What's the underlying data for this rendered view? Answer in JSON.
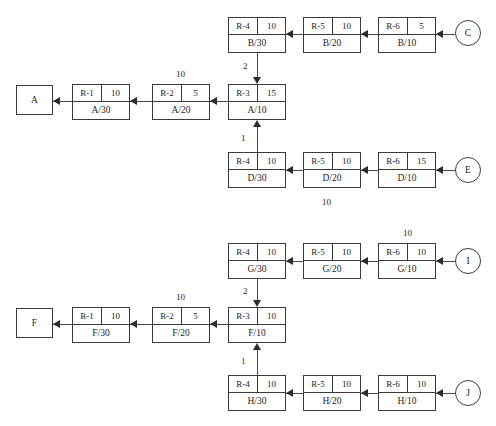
{
  "diagram": {
    "colors": {
      "line": "#4a4a4a",
      "border": "#3a3a3a",
      "text": "#1c1c1c",
      "background": "#ffffff"
    },
    "terminals": {
      "a": "A",
      "f": "F",
      "c": "C",
      "e": "E",
      "i": "I",
      "j": "J"
    },
    "nodes": {
      "b30": {
        "name": "R-4",
        "value": "10",
        "label": "B/30"
      },
      "b20": {
        "name": "R-5",
        "value": "10",
        "label": "B/20"
      },
      "b10": {
        "name": "R-6",
        "value": "5",
        "label": "B/10"
      },
      "a30": {
        "name": "R-1",
        "value": "10",
        "label": "A/30"
      },
      "a20": {
        "name": "R-2",
        "value": "5",
        "label": "A/20"
      },
      "a10": {
        "name": "R-3",
        "value": "15",
        "label": "A/10"
      },
      "d30": {
        "name": "R-4",
        "value": "10",
        "label": "D/30"
      },
      "d20": {
        "name": "R-5",
        "value": "10",
        "label": "D/20"
      },
      "d10": {
        "name": "R-6",
        "value": "15",
        "label": "D/10"
      },
      "g30": {
        "name": "R-4",
        "value": "10",
        "label": "G/30"
      },
      "g20": {
        "name": "R-5",
        "value": "10",
        "label": "G/20"
      },
      "g10": {
        "name": "R-6",
        "value": "10",
        "label": "G/10"
      },
      "f30": {
        "name": "R-1",
        "value": "10",
        "label": "F/30"
      },
      "f20": {
        "name": "R-2",
        "value": "5",
        "label": "F/20"
      },
      "f10": {
        "name": "R-3",
        "value": "10",
        "label": "F/10"
      },
      "h30": {
        "name": "R-4",
        "value": "10",
        "label": "H/30"
      },
      "h20": {
        "name": "R-5",
        "value": "10",
        "label": "H/20"
      },
      "h10": {
        "name": "R-6",
        "value": "10",
        "label": "H/10"
      }
    },
    "edge_labels": {
      "above_a20": "10",
      "b_to_a": "2",
      "d_to_a": "1",
      "below_d20": "10",
      "above_g10": "10",
      "above_f20": "10",
      "g_to_f": "2",
      "h_to_f": "1"
    }
  }
}
